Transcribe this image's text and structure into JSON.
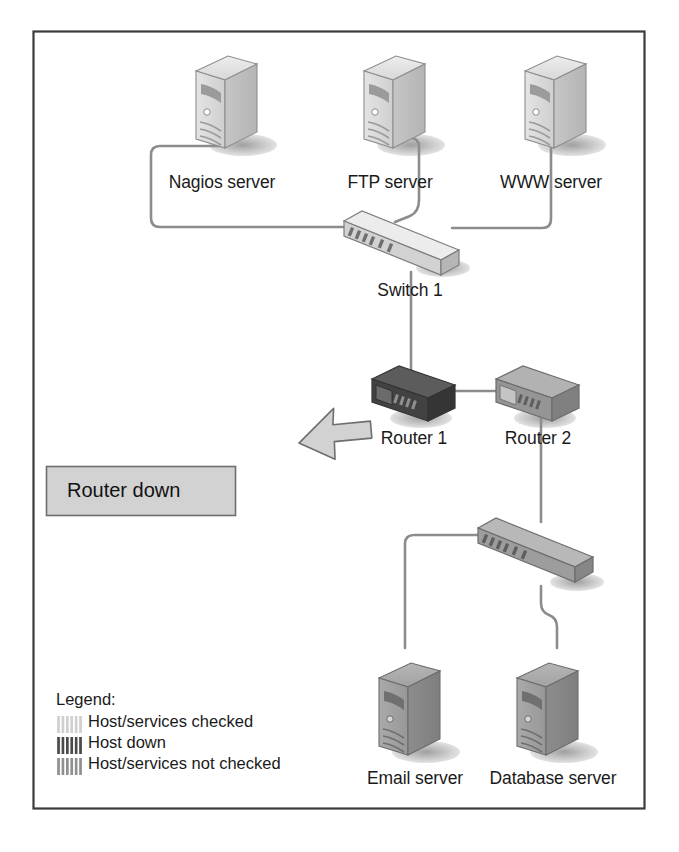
{
  "diagram": {
    "frame": {
      "border_color": "#3b3b3b",
      "background": "#ffffff"
    },
    "link_color": "#8c8c8c",
    "status_colors": {
      "checked": "#d4d4d4",
      "down": "#4a4a4a",
      "not_checked": "#9a9a9a"
    },
    "nodes": [
      {
        "id": "nagios",
        "label": "Nagios server",
        "type": "server",
        "status": "checked",
        "x": 222,
        "y": 183
      },
      {
        "id": "ftp",
        "label": "FTP server",
        "type": "server",
        "status": "checked",
        "x": 390,
        "y": 183
      },
      {
        "id": "www",
        "label": "WWW server",
        "type": "server",
        "status": "checked",
        "x": 551,
        "y": 183
      },
      {
        "id": "switch1",
        "label": "Switch 1",
        "type": "switch",
        "status": "checked",
        "x": 410,
        "y": 311
      },
      {
        "id": "router1",
        "label": "Router 1",
        "type": "router",
        "status": "down",
        "x": 414,
        "y": 439
      },
      {
        "id": "router2",
        "label": "Router 2",
        "type": "router",
        "status": "not_checked",
        "x": 538,
        "y": 439
      },
      {
        "id": "switch2",
        "label": "",
        "type": "switch",
        "status": "not_checked",
        "x": 512,
        "y": 556
      },
      {
        "id": "email",
        "label": "Email server",
        "type": "server",
        "status": "not_checked",
        "x": 415,
        "y": 790
      },
      {
        "id": "database",
        "label": "Database server",
        "type": "server",
        "status": "not_checked",
        "x": 553,
        "y": 790
      }
    ],
    "links": [
      {
        "from": "nagios",
        "to": "switch1"
      },
      {
        "from": "ftp",
        "to": "switch1"
      },
      {
        "from": "www",
        "to": "switch1"
      },
      {
        "from": "switch1",
        "to": "router1"
      },
      {
        "from": "router1",
        "to": "router2"
      },
      {
        "from": "router2",
        "to": "switch2"
      },
      {
        "from": "switch2",
        "to": "email"
      },
      {
        "from": "switch2",
        "to": "database"
      }
    ]
  },
  "callout": {
    "text": "Router down",
    "points_to": "router1",
    "fill": "#d2d2d2",
    "stroke": "#6e6e6e"
  },
  "legend": {
    "title": "Legend:",
    "items": [
      {
        "label": "Host/services checked",
        "swatch": "checked"
      },
      {
        "label": "Host down",
        "swatch": "down"
      },
      {
        "label": "Host/services not checked",
        "swatch": "not_checked"
      }
    ]
  }
}
